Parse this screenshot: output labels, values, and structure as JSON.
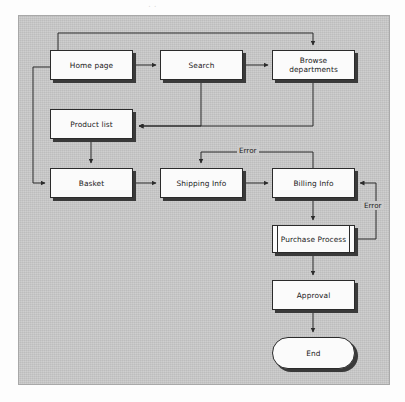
{
  "diagram": {
    "type": "flowchart",
    "title": "",
    "scan_remnant": "..",
    "background_color": "#cacaca",
    "frame_border_color": "#a8a8a8",
    "node_fill_color": "#fbfbfb",
    "node_border_color": "#2b2b2b",
    "node_shadow_color": "#3a3a3a",
    "connector_color": "#2b2b2b",
    "nodes": [
      {
        "id": "home",
        "label": "Home page",
        "shape": "process",
        "x": 50,
        "y": 50,
        "w": 83,
        "h": 30
      },
      {
        "id": "search",
        "label": "Search",
        "shape": "process",
        "x": 160,
        "y": 50,
        "w": 83,
        "h": 30
      },
      {
        "id": "browse",
        "label": "Browse departments",
        "shape": "process",
        "x": 272,
        "y": 50,
        "w": 83,
        "h": 30
      },
      {
        "id": "product",
        "label": "Product list",
        "shape": "process",
        "x": 50,
        "y": 109,
        "w": 83,
        "h": 30
      },
      {
        "id": "basket",
        "label": "Basket",
        "shape": "process",
        "x": 50,
        "y": 168,
        "w": 83,
        "h": 30
      },
      {
        "id": "shipping",
        "label": "Shipping Info",
        "shape": "process",
        "x": 160,
        "y": 168,
        "w": 83,
        "h": 30
      },
      {
        "id": "billing",
        "label": "Billing Info",
        "shape": "process",
        "x": 272,
        "y": 168,
        "w": 83,
        "h": 30
      },
      {
        "id": "purchase",
        "label": "Purchase Process",
        "shape": "predefined-process",
        "x": 272,
        "y": 225,
        "w": 83,
        "h": 28
      },
      {
        "id": "approval",
        "label": "Approval",
        "shape": "process",
        "x": 272,
        "y": 280,
        "w": 83,
        "h": 30
      },
      {
        "id": "end",
        "label": "End",
        "shape": "terminator",
        "x": 272,
        "y": 337,
        "w": 83,
        "h": 32
      }
    ],
    "edges": [
      {
        "from": "home",
        "to": "search",
        "label": ""
      },
      {
        "from": "search",
        "to": "browse",
        "label": ""
      },
      {
        "from": "home",
        "to": "browse",
        "label": ""
      },
      {
        "from": "search",
        "to": "product",
        "label": ""
      },
      {
        "from": "browse",
        "to": "product",
        "label": ""
      },
      {
        "from": "product",
        "to": "basket",
        "label": ""
      },
      {
        "from": "home",
        "to": "basket",
        "label": ""
      },
      {
        "from": "basket",
        "to": "shipping",
        "label": ""
      },
      {
        "from": "shipping",
        "to": "billing",
        "label": ""
      },
      {
        "from": "billing",
        "to": "shipping",
        "label": "Error"
      },
      {
        "from": "billing",
        "to": "purchase",
        "label": ""
      },
      {
        "from": "purchase",
        "to": "billing",
        "label": "Error"
      },
      {
        "from": "purchase",
        "to": "approval",
        "label": ""
      },
      {
        "from": "approval",
        "to": "end",
        "label": ""
      }
    ],
    "edge_labels": [
      {
        "id": "error-top",
        "text": "Error",
        "x": 249,
        "y": 146
      },
      {
        "id": "error-right",
        "text": "Error",
        "x": 362,
        "y": 205
      }
    ]
  }
}
